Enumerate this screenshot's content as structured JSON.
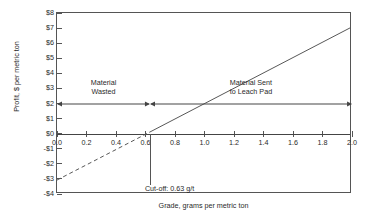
{
  "chart_data": {
    "type": "line",
    "title": "",
    "xlabel": "Grade, grams per metric ton",
    "ylabel": "Profit, $ per metric ton",
    "xlim": [
      0.0,
      2.0
    ],
    "ylim": [
      -4,
      8
    ],
    "grid": false,
    "legend": "none",
    "xticks": [
      "0.0",
      "0.2",
      "0.4",
      "0.6",
      "0.8",
      "1.0",
      "1.2",
      "1.4",
      "1.6",
      "1.8",
      "2.0"
    ],
    "xtick_values": [
      0.0,
      0.2,
      0.4,
      0.6,
      0.8,
      1.0,
      1.2,
      1.4,
      1.6,
      1.8,
      2.0
    ],
    "yticks": [
      "$8",
      "$7",
      "$6",
      "$5",
      "$4",
      "$3",
      "$2",
      "$1",
      "$0",
      "-$1",
      "-$2",
      "-$3",
      "-$4"
    ],
    "ytick_values": [
      8,
      7,
      6,
      5,
      4,
      3,
      2,
      1,
      0,
      -1,
      -2,
      -3,
      -4
    ],
    "series": [
      {
        "name": "profit-below-cutoff",
        "style": "dashed",
        "x": [
          0.0,
          0.63
        ],
        "values": [
          -3.2,
          0.0
        ]
      },
      {
        "name": "profit-above-cutoff",
        "style": "solid",
        "x": [
          0.63,
          2.0
        ],
        "values": [
          0.0,
          7.0
        ]
      },
      {
        "name": "zero-profit-baseline",
        "style": "solid",
        "x": [
          0.0,
          2.0
        ],
        "values": [
          0,
          0
        ]
      }
    ],
    "annotations": {
      "cutoff_value": 0.63,
      "cutoff_label": "Cut-off: 0.63 g/t",
      "region_left_line1": "Material",
      "region_left_line2": "Wasted",
      "region_right_line1": "Material Sent",
      "region_right_line2": "to Leach Pad",
      "span_arrow_y": 2,
      "span_left_from": 0.0,
      "span_left_to": 0.63,
      "span_right_from": 0.63,
      "span_right_to": 2.0
    },
    "colors": {
      "line": "#555555",
      "axis": "#555555",
      "text": "#2a2a2a",
      "background": "#ffffff"
    }
  }
}
